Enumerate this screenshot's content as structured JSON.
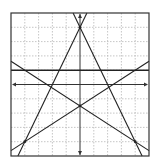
{
  "chart_data": {
    "type": "line",
    "title": "",
    "xlabel": "",
    "ylabel": "",
    "xlim": [
      -5,
      5
    ],
    "ylim": [
      -5,
      5
    ],
    "grid": true,
    "grid_step": 1,
    "axes_arrows": true,
    "series": [
      {
        "name": "y = 2x + 4",
        "slope": 2,
        "intercept": 4
      },
      {
        "name": "y = -2x + 4",
        "slope": -2,
        "intercept": 4
      },
      {
        "name": "y = 0.625x - 1.5",
        "slope": 0.625,
        "intercept": -1.5
      },
      {
        "name": "y = -0.625x - 1.5",
        "slope": -0.625,
        "intercept": -1.5
      },
      {
        "name": "y = 1",
        "slope": 0,
        "intercept": 1
      }
    ],
    "points": [
      {
        "x": 0,
        "y": 4
      },
      {
        "x": 0,
        "y": -1.5
      },
      {
        "x": -4,
        "y": -4
      },
      {
        "x": 4,
        "y": -4
      }
    ]
  },
  "colors": {
    "line": "#222222",
    "axis": "#333333",
    "grid": "#b8b8b8",
    "frame": "#333333",
    "background": "#ffffff"
  }
}
